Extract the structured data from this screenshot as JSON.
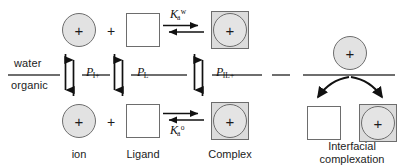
{
  "figure": {
    "background_color": "#ffffff",
    "line_color": "#6e6e6e",
    "species_fill": "#e2e2e2",
    "text_color": "#1c1c1c"
  },
  "phases": {
    "upper_label": "water",
    "lower_label": "organic"
  },
  "species": {
    "ion": {
      "glyph": "+",
      "caption": "ion"
    },
    "ligand": {
      "glyph": "",
      "caption": "Ligand"
    },
    "complex": {
      "glyph": "+",
      "caption": "Complex"
    }
  },
  "operators": {
    "plus": "+"
  },
  "equilibria": {
    "aqueous": {
      "symbol": "K",
      "subscript": "a",
      "superscript": "w",
      "full": "Ka^w"
    },
    "organic": {
      "symbol": "K",
      "subscript": "a",
      "superscript": "o",
      "full": "Ka^o"
    }
  },
  "partition_coefficients": [
    {
      "symbol": "P",
      "subscript": "I+",
      "full": "P_I+"
    },
    {
      "symbol": "P",
      "subscript": "L",
      "full": "P_L"
    },
    {
      "symbol": "P",
      "subscript": "IL+",
      "full": "P_IL+"
    }
  ],
  "right_panel": {
    "caption_line1": "Interfacial",
    "caption_line2": "complexation",
    "caption": "Interfacial complexation"
  }
}
